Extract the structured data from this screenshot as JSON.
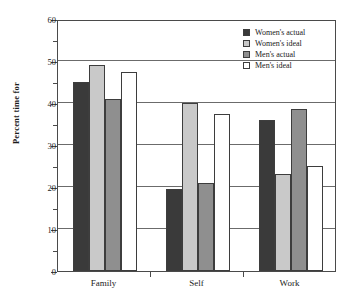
{
  "chart_data": {
    "type": "bar",
    "title": "",
    "subtitle": "",
    "xlabel": "",
    "ylabel": "Percent time for",
    "categories": [
      "Family",
      "Self",
      "Work"
    ],
    "series": [
      {
        "name": "Women's actual",
        "color": "#3a3a3a",
        "values": [
          45,
          19.5,
          36
        ]
      },
      {
        "name": "Women's ideal",
        "color": "#c9c9c9",
        "values": [
          49,
          40,
          23
        ]
      },
      {
        "name": "Men's actual",
        "color": "#8f8f8f",
        "values": [
          41,
          21,
          38.5
        ]
      },
      {
        "name": "Men's ideal",
        "color": "#ffffff",
        "values": [
          47.5,
          37.5,
          25
        ]
      }
    ],
    "ylim": [
      0,
      60
    ],
    "ytick_labels": [
      "0",
      "10",
      "20",
      "30",
      "40",
      "50",
      "60"
    ],
    "ytick_values": [
      0,
      10,
      20,
      30,
      40,
      50,
      60
    ],
    "yminor_values": [
      5,
      15,
      25,
      35,
      45,
      55
    ],
    "grid": "horizontal",
    "legend_position": "top-right",
    "legend_entries": [
      "Women's actual",
      "Women's ideal",
      "Men's actual",
      "Men's ideal"
    ]
  }
}
